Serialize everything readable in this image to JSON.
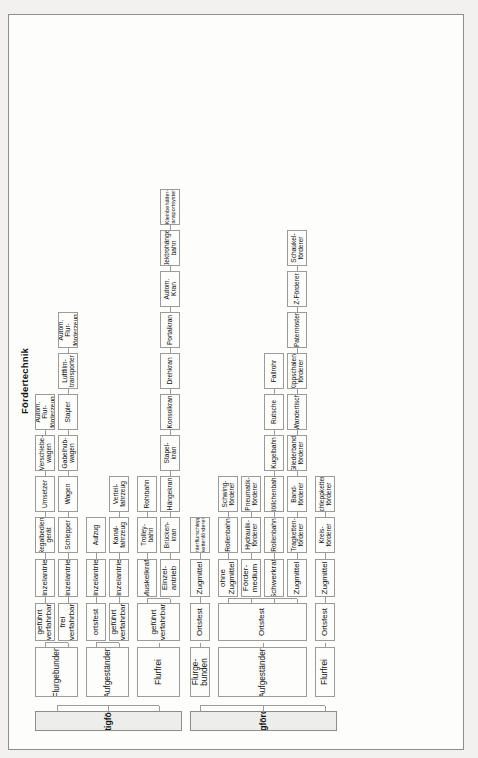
{
  "diagram": {
    "title": "Fördertechnik",
    "type": "tree",
    "orientation": "rotated-90-ccw",
    "language": "de",
    "colors": {
      "page_background": "#f2f1ef",
      "node_fill": "#fdfdfc",
      "level1_fill": "#ededeb",
      "border": "#9b9b9b",
      "text": "#111111"
    },
    "branches": [
      {
        "id": "unstetigfoerderer",
        "label": "Unstetigförderer",
        "groups": [
          {
            "id": "flurgebunden",
            "label": "Flurgebunden",
            "subgroups": [
              {
                "id": "gefuehrt-verfahrbar-1",
                "label": "geführt\nverfahrbar",
                "drive": "Einzelantrieb",
                "leaves": [
                  "Regalbedien-\ngerät",
                  "Umsetzer",
                  "Verschiebe-\nwagen",
                  "Autom. Flur-\nförderzeug"
                ]
              },
              {
                "id": "frei-verfahrbar",
                "label": "frei\nverfahrbar",
                "drive": "Einzelantrieb",
                "leaves": [
                  "Schlepper",
                  "Wagen",
                  "Gabelhub-\nwagen",
                  "Stapler",
                  "Luftfilm-\ntransporter",
                  "Autom. Flur-\nförderzeug"
                ]
              }
            ]
          },
          {
            "id": "aufgestaendert-u",
            "label": "Aufgeständert",
            "subgroups": [
              {
                "id": "ortsfest-u",
                "label": "ortsfest",
                "drive": "Einzelantrieb",
                "leaves": [
                  "Aufzug"
                ]
              },
              {
                "id": "gefuehrt-verfahrbar-2",
                "label": "geführt\nverfahrbar",
                "drive": "Einzelantrieb",
                "leaves": [
                  "Kanal-\nfahrzeug",
                  "Verteil-\nfahrzeug"
                ]
              }
            ]
          },
          {
            "id": "flurfrei-u",
            "label": "Flurfrei",
            "subgroups": [
              {
                "id": "gefuehrt-verfahrbar-3",
                "label": "geführt verfahrbar",
                "drive": "Muskelkraft",
                "drive2": "Einzel-\nantrieb",
                "leaves_muskelkraft": [
                  "Trolley-\nbahn",
                  "Rohrbahn"
                ],
                "leaves_einzelantrieb": [
                  "Brücken-\nkran",
                  "Hängekran",
                  "Stapel-\nkran",
                  "Konsolkran",
                  "Drehkran",
                  "Portalkran",
                  "Autom.\nKran",
                  "Elektrohänge-\nbahn",
                  "Kleinbehälter-\ntransportsystem"
                ]
              }
            ]
          }
        ]
      },
      {
        "id": "stetigfoerderer",
        "label": "Stetigförderer",
        "groups": [
          {
            "id": "flurgebunden-s",
            "label": "Flurge-\nbunden",
            "subgroups": [
              {
                "id": "ortsfest-s1",
                "label": "Ortsfest",
                "drive": "Zugmittel",
                "leaves": [
                  "Unterflurschlepp-\nkettenförderer"
                ]
              }
            ]
          },
          {
            "id": "aufgestaendert-s",
            "label": "Aufgeständert",
            "subgroups": [
              {
                "id": "ortsfest-s2",
                "label": "Ortsfest",
                "drives": [
                  {
                    "label": "ohne\nZugmittel",
                    "leaves": [
                      "Rollenbahn",
                      "Schwing-\nförderer"
                    ]
                  },
                  {
                    "label": "Förder-\nmedium",
                    "leaves": [
                      "Hydraulik-\nförderer",
                      "Pneumatik-\nförderer"
                    ]
                  },
                  {
                    "label": "Schwerkraft",
                    "leaves": [
                      "Rollenbahn",
                      "Röllchenbahn",
                      "Kugelbahn",
                      "Rutsche",
                      "Fallrohr"
                    ]
                  },
                  {
                    "label": "Zugmittel",
                    "leaves": [
                      "Tragketten-\nförderer",
                      "Band-\nförderer",
                      "Gliederband-\nförderer",
                      "Wandertisch",
                      "Kippschalen-\nförderer",
                      "Paternoster",
                      "Z-Förderer",
                      "Schaukel-\nförderer"
                    ]
                  }
                ]
              }
            ]
          },
          {
            "id": "flurfrei-s",
            "label": "Flurfrei",
            "subgroups": [
              {
                "id": "ortsfest-s3",
                "label": "Ortsfest",
                "drive": "Zugmittel",
                "leaves": [
                  "Kreis-\nförderer",
                  "Schleppketten-\nförderer"
                ]
              }
            ]
          }
        ]
      }
    ]
  }
}
